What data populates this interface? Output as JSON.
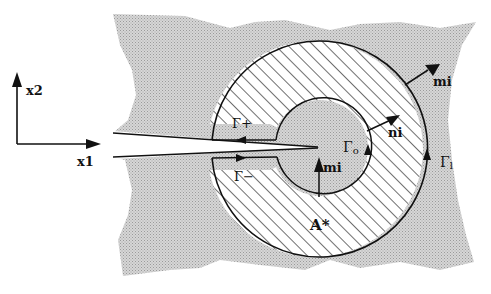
{
  "diagram": {
    "axes": {
      "x_label": "x1",
      "y_label": "x2"
    },
    "labels": {
      "gamma_plus": "Γ+",
      "gamma_minus": "Γ−",
      "gamma_0": "Γ",
      "gamma_0_sub": "o",
      "gamma_1": "Γ",
      "gamma_1_sub": "l",
      "normal_inner": "ni",
      "normal_m_inner": "mi",
      "normal_m_outer": "mi",
      "area": "A*"
    },
    "colors": {
      "body_fill": "#c8c8c8",
      "hatch": "#222222",
      "outline": "#111111",
      "background": "#ffffff"
    }
  }
}
